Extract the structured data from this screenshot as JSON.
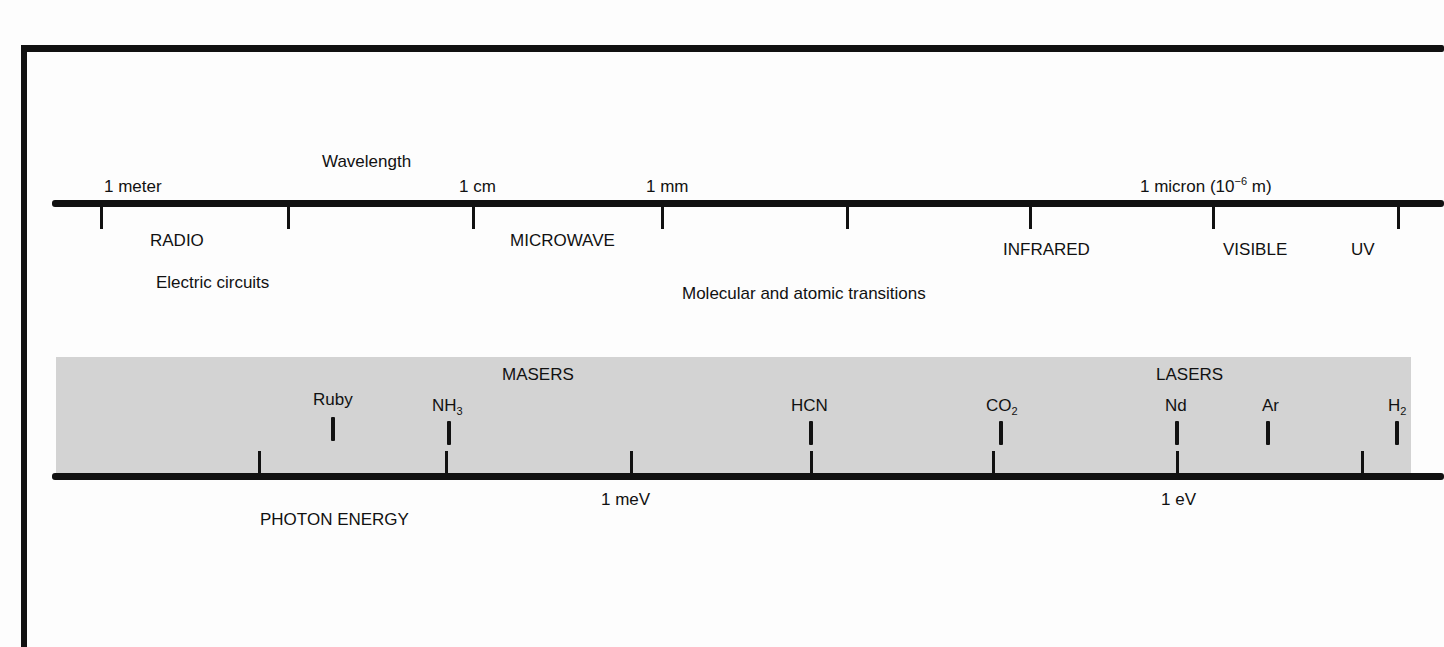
{
  "diagram": {
    "wavelength_axis": {
      "title": "Wavelength",
      "scale_labels": [
        {
          "text": "1 meter",
          "x": 104
        },
        {
          "text": "1 cm",
          "x": 459
        },
        {
          "text": "1 mm",
          "x": 646
        },
        {
          "text_main": "1 micron (10",
          "text_sup": "−6",
          "text_tail": " m)",
          "x": 1140
        }
      ],
      "tick_x": [
        101,
        288,
        473,
        662,
        847,
        1030,
        1213,
        1398
      ],
      "regions": [
        {
          "name": "RADIO",
          "x": 150
        },
        {
          "name": "MICROWAVE",
          "x": 510
        },
        {
          "name": "INFRARED",
          "x": 1003
        },
        {
          "name": "VISIBLE",
          "x": 1223
        },
        {
          "name": "UV",
          "x": 1351
        }
      ],
      "annotations": [
        {
          "text": "Electric circuits",
          "x": 156
        },
        {
          "text": "Molecular and atomic transitions",
          "x": 682
        }
      ]
    },
    "energy_axis": {
      "title": "PHOTON ENERGY",
      "scale_labels": [
        {
          "text": "1 meV",
          "x": 601
        },
        {
          "text": "1 eV",
          "x": 1161
        }
      ],
      "tick_x": [
        259,
        446,
        631,
        811,
        993,
        1177,
        1362
      ]
    },
    "band": {
      "color": "#d3d3d3",
      "group_labels": [
        {
          "text": "MASERS",
          "x": 502
        },
        {
          "text": "LASERS",
          "x": 1156
        }
      ],
      "sources": [
        {
          "name": "Ruby",
          "sub": "",
          "x": 313,
          "mark_x": 333
        },
        {
          "name": "NH",
          "sub": "3",
          "x": 432,
          "mark_x": 449
        },
        {
          "name": "HCN",
          "sub": "",
          "x": 791,
          "mark_x": 811
        },
        {
          "name": "CO",
          "sub": "2",
          "x": 986,
          "mark_x": 1001
        },
        {
          "name": "Nd",
          "sub": "",
          "x": 1165,
          "mark_x": 1177
        },
        {
          "name": "Ar",
          "sub": "",
          "x": 1262,
          "mark_x": 1268
        },
        {
          "name": "H",
          "sub": "2",
          "x": 1388,
          "mark_x": 1397
        }
      ]
    }
  }
}
